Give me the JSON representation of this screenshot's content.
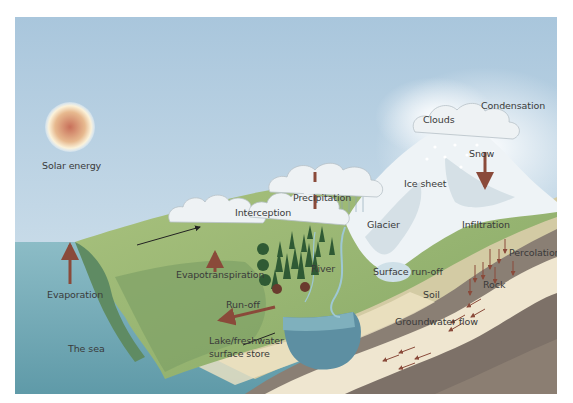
{
  "diagram": {
    "title": "",
    "type": "water-cycle",
    "labels": {
      "solar_energy": "Solar energy",
      "evaporation": "Evaporation",
      "the_sea": "The sea",
      "interception": "Interception",
      "evapotranspiration": "Evapotranspiration",
      "precipitation": "Precipitation",
      "river": "River",
      "run_off": "Run-off",
      "lake_line1": "Lake/freshwater",
      "lake_line2": "surface store",
      "clouds": "Clouds",
      "condensation": "Condensation",
      "snow": "Snow",
      "ice_sheet": "Ice sheet",
      "glacier": "Glacier",
      "surface_run_off": "Surface run-off",
      "soil": "Soil",
      "infiltration": "Infiltration",
      "percolation": "Percolation",
      "rock": "Rock",
      "groundwater_flow": "Groundwater flow"
    },
    "colors": {
      "sky_top": "#a9c6dc",
      "sky_bottom": "#d8e7f0",
      "sea": "#6fa9b5",
      "land": "#9cba74",
      "land_dark": "#6f9a5a",
      "snow": "#f3f6f8",
      "arrow": "#8a4a3a",
      "soil_layer": "#c9c19a",
      "rock_layer": "#8a7f74",
      "rock_light": "#e6dcc6",
      "lake": "#5d8fa2"
    }
  }
}
